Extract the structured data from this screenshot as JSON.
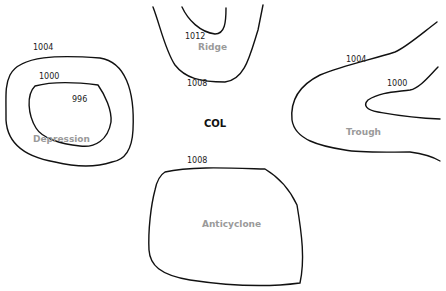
{
  "diagram": {
    "systems": {
      "depression": {
        "label": "Depression",
        "isobars": [
          "1004",
          "1000",
          "996"
        ]
      },
      "ridge": {
        "label": "Ridge",
        "isobars": [
          "1012",
          "1008"
        ]
      },
      "trough": {
        "label": "Trough",
        "isobars": [
          "1004",
          "1000"
        ]
      },
      "anticyclone": {
        "label": "Anticyclone",
        "isobars": [
          "1008"
        ]
      },
      "col": {
        "label": "COL"
      }
    },
    "colors": {
      "isobar": "#111111",
      "system_label": "#9a9a9a",
      "col_label": "#111111"
    }
  }
}
